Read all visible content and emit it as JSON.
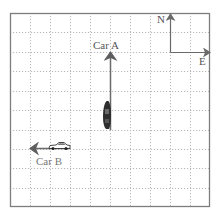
{
  "figure": {
    "grid": {
      "columns": 10,
      "rows": 10,
      "style": "dotted",
      "color": "#b5b5b5",
      "frame_color": "#7a7a7a"
    },
    "compass": {
      "north_label": "N",
      "east_label": "E"
    },
    "car_a": {
      "label": "Car A",
      "direction": "north"
    },
    "car_b": {
      "label": "Car B",
      "direction": "west"
    },
    "arrow_color": "#6f6f6f"
  }
}
